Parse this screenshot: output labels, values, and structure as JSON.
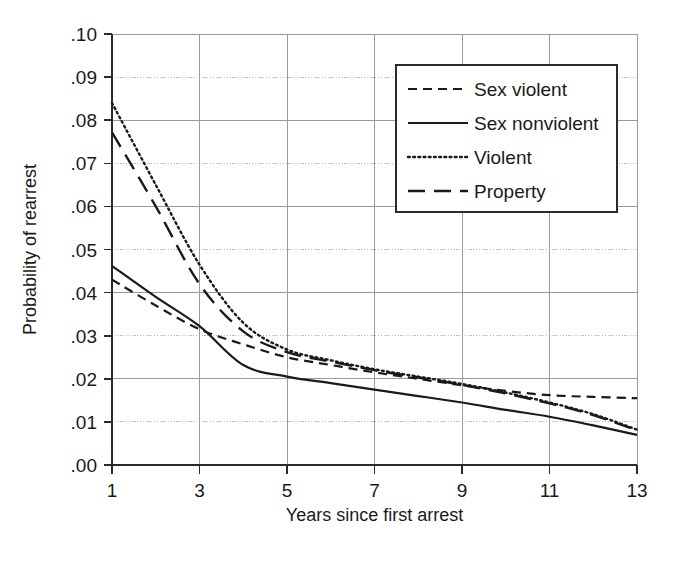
{
  "chart_data": {
    "type": "line",
    "title": "",
    "xlabel": "Years since first arrest",
    "ylabel": "Probability of rearrest",
    "xlim": [
      1,
      13
    ],
    "ylim": [
      0.0,
      0.1
    ],
    "grid": true,
    "legend_position": "top-right",
    "x": [
      1,
      2,
      3,
      4,
      5,
      6,
      7,
      8,
      9,
      10,
      11,
      12,
      13
    ],
    "xticks": [
      "1",
      "3",
      "5",
      "7",
      "9",
      "11",
      "13"
    ],
    "xtick_values": [
      1,
      3,
      5,
      7,
      9,
      11,
      13
    ],
    "yticks": [
      ".00",
      ".01",
      ".02",
      ".03",
      ".04",
      ".05",
      ".06",
      ".07",
      ".08",
      ".09",
      ".10"
    ],
    "ytick_values": [
      0.0,
      0.01,
      0.02,
      0.03,
      0.04,
      0.05,
      0.06,
      0.07,
      0.08,
      0.09,
      0.1
    ],
    "series": [
      {
        "name": "Sex violent",
        "style": "dashed",
        "color": "#1a1a1a",
        "values": [
          0.043,
          0.037,
          0.0315,
          0.028,
          0.025,
          0.0232,
          0.0215,
          0.02,
          0.0185,
          0.0172,
          0.0162,
          0.0158,
          0.0155
        ]
      },
      {
        "name": "Sex nonviolent",
        "style": "solid",
        "color": "#1a1a1a",
        "values": [
          0.0462,
          0.039,
          0.0322,
          0.0232,
          0.0205,
          0.019,
          0.0175,
          0.016,
          0.0145,
          0.0128,
          0.0112,
          0.0092,
          0.007
        ]
      },
      {
        "name": "Violent",
        "style": "dotted",
        "color": "#1a1a1a",
        "values": [
          0.084,
          0.065,
          0.0465,
          0.033,
          0.0268,
          0.0243,
          0.0222,
          0.0205,
          0.0188,
          0.0168,
          0.0145,
          0.0118,
          0.0082
        ]
      },
      {
        "name": "Property",
        "style": "longdash",
        "color": "#1a1a1a",
        "values": [
          0.0772,
          0.06,
          0.042,
          0.031,
          0.0262,
          0.024,
          0.022,
          0.0203,
          0.0186,
          0.0166,
          0.0143,
          0.0116,
          0.008
        ]
      }
    ]
  },
  "legend": {
    "items": [
      {
        "label": "Sex violent"
      },
      {
        "label": "Sex nonviolent"
      },
      {
        "label": "Violent"
      },
      {
        "label": "Property"
      }
    ]
  },
  "axes": {
    "x_title": "Years since first arrest",
    "y_title": "Probability of rearrest"
  }
}
